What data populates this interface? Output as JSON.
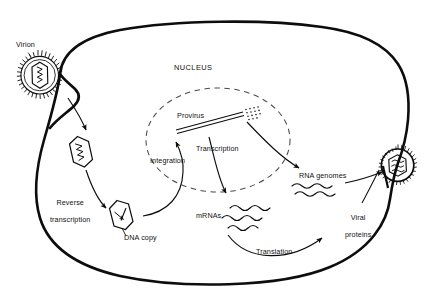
{
  "figure": {
    "title_text": "Retrovirus replication cycle",
    "stroke_color": "#0d0d0d",
    "label_color": "#111111",
    "background_color": "#ffffff",
    "membrane_color": "#0d0d0d"
  },
  "labels": {
    "virion": "Virion",
    "nucleus": "NUCLEUS",
    "provirus": "Provirus",
    "integration": "Integration",
    "transcription": "Transcription",
    "reverse_transcription_line1": "Reverse",
    "reverse_transcription_line2": "transcription",
    "dna_copy": "DNA copy",
    "mrnas": "mRNAs",
    "rna_genomes": "RNA genomes",
    "viral_proteins_line1": "Viral",
    "viral_proteins_line2": "proteins",
    "translation": "Translation"
  },
  "structures": {
    "cell_membrane": "cell-membrane-outline",
    "nuclear_envelope": "dashed-nuclear-membrane",
    "free_virion": "enveloped-virion-with-capsid",
    "uncoated_capsid": "capsid-with-rna-genome",
    "dna_capsid": "capsid-with-dna-copy",
    "budding_virion": "budding-enveloped-virion",
    "provirus_dna": "integrated-provirus-dna",
    "mrna_strands": 3,
    "rna_genome_strands": 2
  },
  "steps": [
    {
      "id": "entry",
      "label": ""
    },
    {
      "id": "reverse-transcription",
      "label": "Reverse transcription"
    },
    {
      "id": "integration",
      "label": "Integration"
    },
    {
      "id": "transcription",
      "label": "Transcription"
    },
    {
      "id": "translation",
      "label": "Translation"
    },
    {
      "id": "assembly-budding",
      "label": ""
    }
  ]
}
